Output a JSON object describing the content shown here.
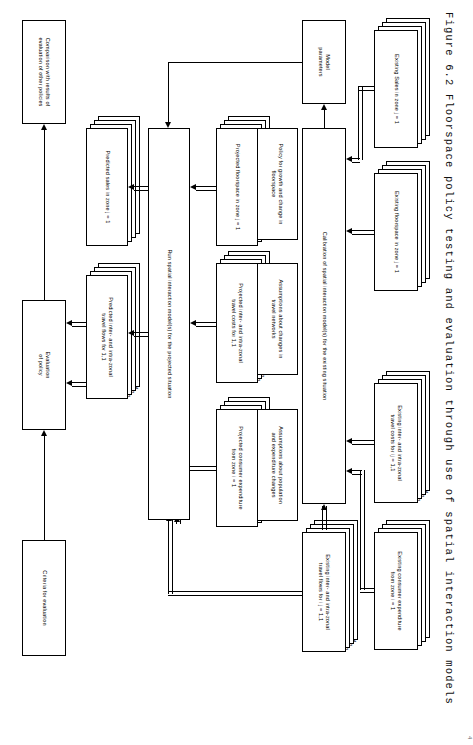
{
  "figure": {
    "caption": "Figure 6.2   Floorspace policy testing and evaluation through use of spatial interaction models",
    "corner_mark": "4"
  },
  "boxes": {
    "existing_sales": {
      "label": "Existing Sales in zone j = 1"
    },
    "existing_floorspace": {
      "label": "Existing floorspace in zone j = 1"
    },
    "existing_travel_costs": {
      "label": "Existing inter- and intra-zonal\ntravel costs for ij = 1,1"
    },
    "existing_consumer_exp": {
      "label": "Existing consumer expenditure\nfrom zone i = 1"
    },
    "calibration": {
      "label": "Calibration of spatial interaction model(s) for the existing situation"
    },
    "model_parameters": {
      "label": "Model\nparameters"
    },
    "existing_travel_flows": {
      "label": "Existing inter- and intra-zonal\ntravel flows for i j = 1,1"
    },
    "policy_growth": {
      "label": "Policy for growth and change in\nfloorspace"
    },
    "assumptions_travel": {
      "label": "Assumptions about changes in\ntravel networks"
    },
    "assumptions_pop": {
      "label": "Assumptions about population\nand expenditure changes"
    },
    "projected_floorspace": {
      "label": "Projected floorspace in zone j = 1"
    },
    "projected_travel_costs": {
      "label": "Projected inter- and intra-zonal\ntravel costs for 1,1"
    },
    "projected_consumer_exp": {
      "label": "Projected consumer expenditure\nfrom zone i = 1"
    },
    "run_models": {
      "label": "Run spatial interaction model(s) for the projected situation"
    },
    "predicted_sales": {
      "label": "Predicted sales in zone j = 1"
    },
    "predicted_travel_flows": {
      "label": "Predicted inter- and intra-zonal\ntravel flows for 1,1"
    },
    "evaluation_of_policy": {
      "label": "Evaluation\nof policy"
    },
    "criteria": {
      "label": "Criteria for evaluation"
    },
    "comparison": {
      "label": "Comparison with results of\nevaluation of other policies"
    }
  },
  "stack_numbers": [
    "2",
    "3",
    "4"
  ],
  "stack_numbers_ij": [
    "1,2",
    "1,3",
    "1,4"
  ],
  "colors": {
    "stroke": "#000000",
    "background": "#ffffff",
    "text": "#000000"
  }
}
